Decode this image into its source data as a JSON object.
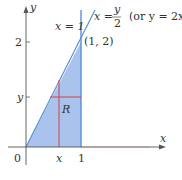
{
  "diagram": {
    "axes": {
      "x_label": "x",
      "y_label": "y",
      "origin_label": "0"
    },
    "ticks": {
      "x_tick_1": "1",
      "x_tick_var": "x",
      "y_tick_2": "2",
      "y_tick_var": "y"
    },
    "lines": {
      "vertical_line_label": "x = 1",
      "diagonal_line_lhs": "x =",
      "diagonal_line_frac_num": "y",
      "diagonal_line_frac_den": "2",
      "diagonal_line_alt": "(or y = 2x)"
    },
    "point_label": "(1, 2)",
    "region_label": "R",
    "colors": {
      "fill": "#a9c3ec",
      "line": "#5b8fd6",
      "cross": "#d0404a",
      "axis": "#555555"
    }
  }
}
